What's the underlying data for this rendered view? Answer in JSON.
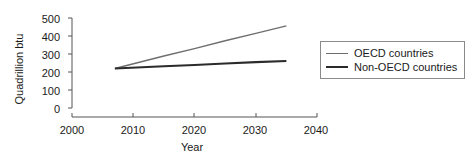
{
  "chart_data": {
    "type": "line",
    "title": "",
    "xlabel": "Year",
    "ylabel": "Quadrillion btu",
    "xlim": [
      2000,
      2040
    ],
    "ylim": [
      0,
      500
    ],
    "xticks": [
      2000,
      2010,
      2020,
      2030,
      2040
    ],
    "yticks": [
      0,
      100,
      200,
      300,
      400,
      500
    ],
    "grid": false,
    "legend_position": "right",
    "series": [
      {
        "name": "OECD countries",
        "color": "#6e6e6e",
        "x": [
          2007,
          2015,
          2020,
          2025,
          2030,
          2035
        ],
        "values": [
          245,
          308,
          345,
          385,
          422,
          460
        ]
      },
      {
        "name": "Non-OECD countries",
        "color": "#2b2b2b",
        "x": [
          2007,
          2015,
          2020,
          2025,
          2030,
          2035
        ],
        "values": [
          245,
          256,
          263,
          270,
          277,
          283
        ]
      }
    ]
  },
  "axis": {
    "y_title": "Quadrillion btu",
    "x_title": "Year",
    "y_tick_labels": [
      "500",
      "400",
      "300",
      "200",
      "100",
      "0"
    ],
    "x_tick_labels": [
      "2000",
      "2010",
      "2020",
      "2030",
      "2040"
    ]
  },
  "legend": {
    "items": [
      {
        "label": "OECD countries",
        "swatch": "line-swatch-light"
      },
      {
        "label": "Non-OECD countries",
        "swatch": "line-swatch-dark"
      }
    ]
  }
}
